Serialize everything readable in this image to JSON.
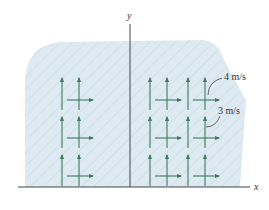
{
  "figure": {
    "type": "velocity-field-diagram",
    "axes": {
      "x_label": "x",
      "y_label": "y"
    },
    "annotations": [
      {
        "label": "4 m/s",
        "target": "vertical-arrow-component"
      },
      {
        "label": "3 m/s",
        "target": "horizontal-arrow-component"
      }
    ],
    "arrow_grid": {
      "rows": 3,
      "groups_left_of_y_axis": 1,
      "groups_right_of_y_axis": 2,
      "vertical_component": "4 m/s",
      "horizontal_component": "3 m/s"
    },
    "colors": {
      "fluid_region": "#dbe9f1",
      "hatch": "#c4d6e2",
      "arrow": "#3d7a5e",
      "axis": "#444444"
    },
    "caption": ""
  }
}
